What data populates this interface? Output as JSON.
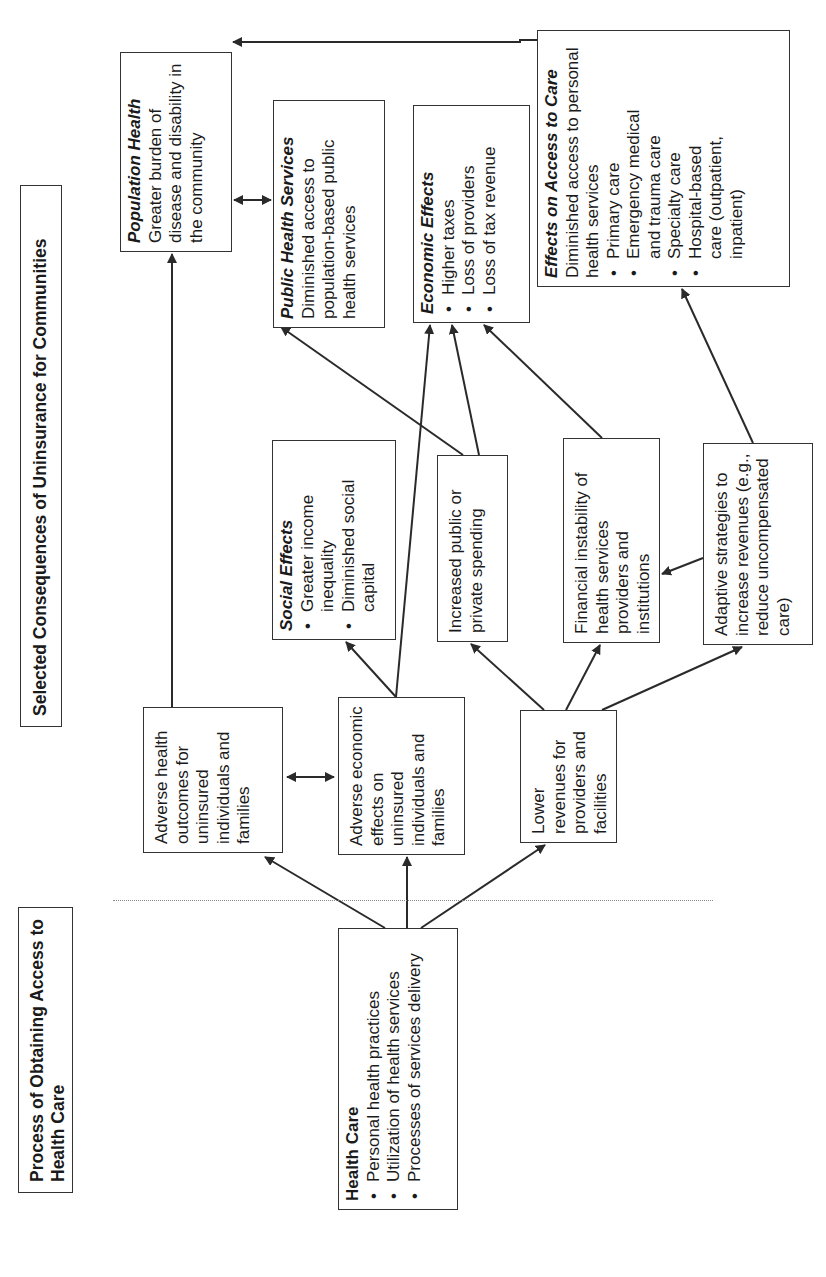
{
  "titles": {
    "process": "Process of Obtaining Access to Health Care",
    "consequences": "Selected Consequences of Uninsurance for Communities"
  },
  "health_care": {
    "heading": "Health Care",
    "items": [
      "Personal health practices",
      "Utilization of health services",
      "Processes of services delivery"
    ]
  },
  "adverse_health": {
    "text": "Adverse health outcomes for uninsured individuals and families"
  },
  "adverse_economic": {
    "text": "Adverse economic effects on uninsured individuals and families"
  },
  "lower_revenues": {
    "text": "Lower revenues for providers and facilities"
  },
  "social_effects": {
    "heading": "Social Effects",
    "items": [
      "Greater income inequality",
      "Diminished social capital"
    ]
  },
  "increased_spending": {
    "text": "Increased public or private spending"
  },
  "financial_instability": {
    "text": "Financial instability of health services providers and institutions"
  },
  "adaptive_strategies": {
    "text": "Adaptive strategies to increase revenues (e.g., reduce uncompensated care)"
  },
  "population_health": {
    "heading": "Population Health",
    "text": "Greater burden of disease and disability in the community"
  },
  "public_health_services": {
    "heading": "Public Health Services",
    "text": "Diminished access to population-based public health services"
  },
  "economic_effects": {
    "heading": "Economic Effects",
    "items": [
      "Higher taxes",
      "Loss of providers",
      "Loss of tax revenue"
    ]
  },
  "effects_on_access": {
    "heading": "Effects on Access to Care",
    "text": "Diminished access to personal health services",
    "items": [
      "Primary care",
      "Emergency medical and trauma care",
      "Specialty care",
      "Hospital-based care (outpatient, inpatient)"
    ]
  },
  "colors": {
    "line": "#2a2a2a",
    "border": "#333333",
    "divider": "#888888"
  }
}
